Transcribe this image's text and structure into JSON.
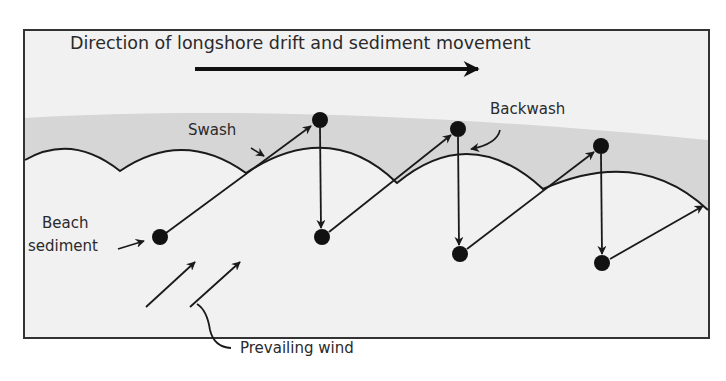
{
  "diagram": {
    "type": "process-diagram",
    "topic": "longshore drift",
    "labels": {
      "direction": "Direction of longshore drift and sediment movement",
      "swash": "Swash",
      "backwash": "Backwash",
      "beach_sediment_line1": "Beach",
      "beach_sediment_line2": "sediment",
      "prevailing_wind": "Prevailing wind"
    },
    "colors": {
      "background": "#f1f1f1",
      "sea_band": "#d6d6d6",
      "lines": "#1a1a1a",
      "border": "#333333"
    },
    "sediment_positions": [
      {
        "x": 160,
        "y": 237
      },
      {
        "x": 320,
        "y": 120
      },
      {
        "x": 322,
        "y": 237
      },
      {
        "x": 458,
        "y": 129
      },
      {
        "x": 460,
        "y": 254
      },
      {
        "x": 601,
        "y": 146
      },
      {
        "x": 602,
        "y": 263
      }
    ],
    "movements": [
      {
        "kind": "swash",
        "from": 0,
        "to": 1
      },
      {
        "kind": "backwash",
        "from": 1,
        "to": 2
      },
      {
        "kind": "swash",
        "from": 2,
        "to": 3
      },
      {
        "kind": "backwash",
        "from": 3,
        "to": 4
      },
      {
        "kind": "swash",
        "from": 4,
        "to": 5
      },
      {
        "kind": "backwash",
        "from": 5,
        "to": 6
      },
      {
        "kind": "swash",
        "from": 6,
        "to": "off-right"
      }
    ]
  }
}
